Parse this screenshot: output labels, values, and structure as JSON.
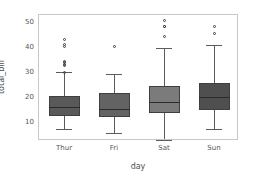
{
  "chart_data": {
    "type": "box",
    "title": "",
    "xlabel": "day",
    "ylabel": "total_bill",
    "categories": [
      "Thur",
      "Fri",
      "Sat",
      "Sun"
    ],
    "ylim": [
      2.5,
      53
    ],
    "yticks": [
      10,
      20,
      30,
      40,
      50
    ],
    "ytick_labels": [
      "10",
      "20",
      "30",
      "40",
      "50"
    ],
    "grid": false,
    "legend": false,
    "box_colors": [
      "#595959",
      "#636363",
      "#7b7b7b",
      "#4f4f4f"
    ],
    "boxes": [
      {
        "name": "Thur",
        "q1": 12.4,
        "median": 16.2,
        "q3": 20.5,
        "whisker_low": 7.5,
        "whisker_high": 30.0,
        "fliers": [
          30.0,
          32.7,
          33.2,
          34.0,
          34.3,
          40.2,
          41.2,
          43.1
        ],
        "color": "#595959"
      },
      {
        "name": "Fri",
        "q1": 12.1,
        "median": 15.4,
        "q3": 21.9,
        "whisker_low": 5.8,
        "whisker_high": 29.4,
        "fliers": [
          40.2
        ],
        "color": "#636363"
      },
      {
        "name": "Sat",
        "q1": 13.9,
        "median": 18.2,
        "q3": 24.7,
        "whisker_low": 3.1,
        "whisker_high": 39.8,
        "fliers": [
          44.3,
          48.2,
          48.3,
          50.8
        ],
        "color": "#7b7b7b"
      },
      {
        "name": "Sun",
        "q1": 14.9,
        "median": 20.3,
        "q3": 25.6,
        "whisker_low": 7.3,
        "whisker_high": 41.0,
        "fliers": [
          45.4,
          48.2
        ],
        "color": "#4f4f4f"
      }
    ]
  },
  "figure": {
    "background_color": "#ffffff",
    "axes_edge_color": "#c8c8c8",
    "tick_label_color": "#565656",
    "axis_label_color": "#4d4d4d"
  }
}
